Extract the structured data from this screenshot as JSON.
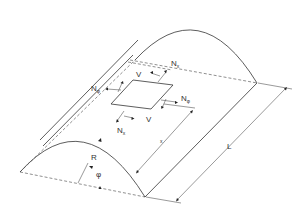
{
  "diagram": {
    "labels": {
      "n_x_top": "N",
      "n_x_top_sub": "x",
      "n_x_bottom": "N",
      "n_x_bottom_sub": "x",
      "n_phi_left": "N",
      "n_phi_left_sub": "φ",
      "n_phi_right": "N",
      "n_phi_right_sub": "φ",
      "v_top": "V",
      "v_bottom": "V",
      "x_dim": "x",
      "length_dim": "L",
      "radius": "R",
      "angle": "φ"
    },
    "colors": {
      "line": "#333333",
      "background": "#ffffff"
    }
  }
}
